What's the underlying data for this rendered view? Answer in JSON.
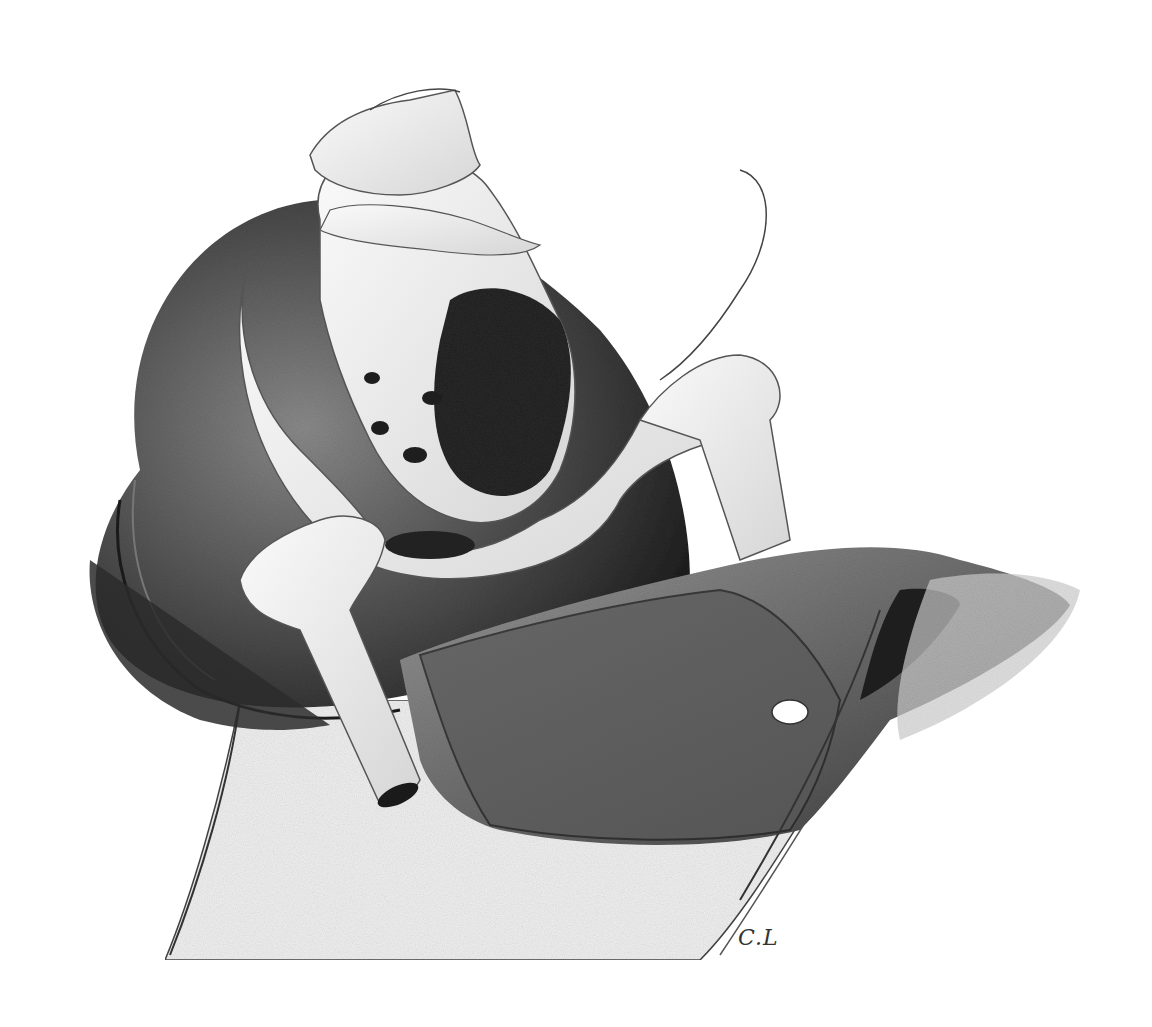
{
  "artwork": {
    "type": "pencil drawing",
    "subject": "pelvis and femur bones resting in a dark saddle-like cushion form",
    "signature": "C.L",
    "palette": {
      "paper": "#ffffff",
      "dark_shade": "#2a2a2a",
      "mid_shade": "#6b6b6b",
      "light_shade": "#bdbdbd",
      "bone": "#f2f2f2"
    }
  }
}
